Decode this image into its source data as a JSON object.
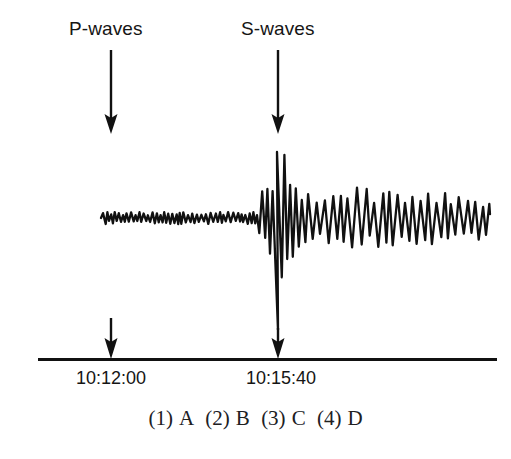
{
  "figure": {
    "type": "seismogram",
    "background_color": "#ffffff",
    "ink_color": "#111111",
    "annotations": [
      {
        "name": "p-waves",
        "label": "P-waves",
        "label_x": 111,
        "label_y": 30,
        "arrow_x": 111,
        "arrow_top_y": 50,
        "arrow_bottom_y": 133,
        "axis_arrow_top_y": 318,
        "axis_arrow_bottom_y": 358
      },
      {
        "name": "s-waves",
        "label": "S-waves",
        "label_x": 281,
        "label_y": 30,
        "arrow_x": 278,
        "arrow_top_y": 50,
        "arrow_bottom_y": 133,
        "axis_arrow_top_y": 326,
        "axis_arrow_bottom_y": 358
      }
    ],
    "axis": {
      "name": "time-axis",
      "y": 359,
      "x_start": 38,
      "x_end": 497,
      "thickness": 3
    },
    "time_labels": [
      {
        "text": "10:12:00",
        "center_x": 111,
        "y": 368
      },
      {
        "text": "10:15:40",
        "center_x": 281,
        "y": 368
      }
    ]
  },
  "chart_data": {
    "type": "line",
    "title": "",
    "xlabel": "",
    "ylabel": "",
    "x_tick_labels": [
      "10:12:00",
      "10:15:40"
    ],
    "x_tick_positions": [
      111,
      281
    ],
    "grid": false,
    "legend": "none",
    "baseline_y": 218,
    "trace_x_start": 103,
    "trace_x_end": 490,
    "phases": [
      {
        "name": "pre-arrival-noise",
        "x_start": 103,
        "x_end": 258,
        "amplitude": 6,
        "note": "low amplitude background noise following P-wave arrival"
      },
      {
        "name": "s-wave-arrival",
        "x_start": 258,
        "x_end": 300,
        "amplitude": 66,
        "note": "large amplitude burst; tallest peak y=152, deepest trough y=330"
      },
      {
        "name": "coda",
        "x_start": 300,
        "x_end": 490,
        "amplitude": 34,
        "note": "sustained moderate amplitude oscillations decaying slowly"
      }
    ],
    "annotations": [
      {
        "text": "P-waves",
        "x": 111
      },
      {
        "text": "S-waves",
        "x": 281
      }
    ],
    "peak_max": {
      "x": 277,
      "y": 152
    },
    "peak_min": {
      "x": 278,
      "y": 330
    }
  },
  "question": {
    "choices_line": "(1) A  (2) B  (3) C  (4) D",
    "choices": [
      {
        "number": "(1)",
        "letter": "A"
      },
      {
        "number": "(2)",
        "letter": "B"
      },
      {
        "number": "(3)",
        "letter": "C"
      },
      {
        "number": "(4)",
        "letter": "D"
      }
    ]
  }
}
